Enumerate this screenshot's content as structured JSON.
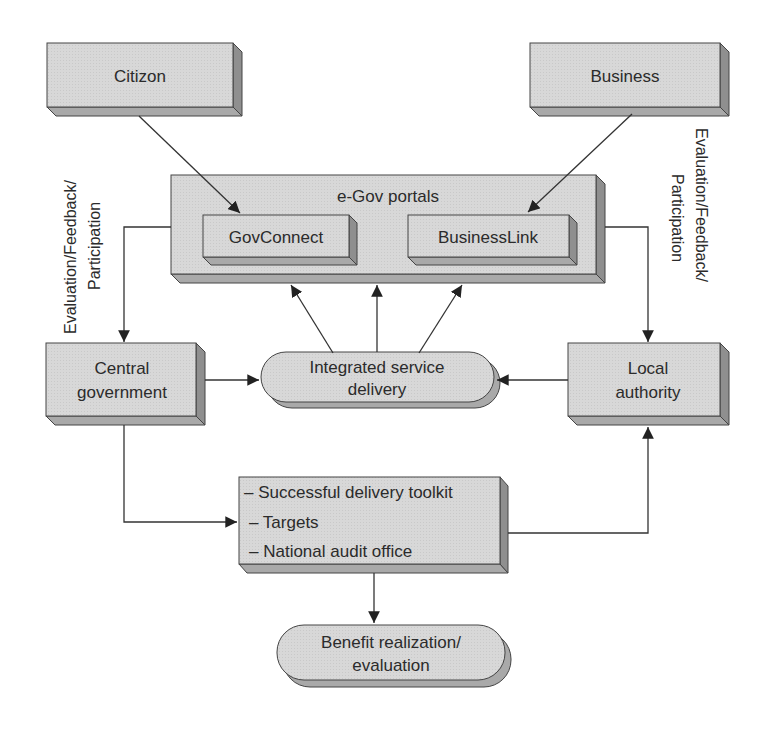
{
  "diagram": {
    "nodes": {
      "citizen": {
        "label": "Citizon"
      },
      "business": {
        "label": "Business"
      },
      "egov_portals": {
        "label": "e-Gov portals"
      },
      "govconnect": {
        "label": "GovConnect"
      },
      "businesslink": {
        "label": "BusinessLink"
      },
      "central_government": {
        "line1": "Central",
        "line2": "government"
      },
      "local_authority": {
        "line1": "Local",
        "line2": "authority"
      },
      "integrated_service": {
        "line1": "Integrated service",
        "line2": "delivery"
      },
      "toolkit": {
        "items": [
          "– Successful delivery toolkit",
          "– Targets",
          "– National audit office"
        ]
      },
      "benefit": {
        "line1": "Benefit realization/",
        "line2": "evaluation"
      }
    },
    "side_labels": {
      "left": {
        "line1": "Evaluation/Feedback/",
        "line2": "Participation"
      },
      "right": {
        "line1": "Evaluation/Feedback/",
        "line2": "Participation"
      }
    },
    "edges": [
      {
        "from": "citizen",
        "to": "govconnect"
      },
      {
        "from": "business",
        "to": "businesslink"
      },
      {
        "from": "egov_portals",
        "to": "central_government"
      },
      {
        "from": "egov_portals",
        "to": "local_authority"
      },
      {
        "from": "integrated_service",
        "to": "egov_portals",
        "count": 3
      },
      {
        "from": "central_government",
        "to": "integrated_service"
      },
      {
        "from": "local_authority",
        "to": "integrated_service"
      },
      {
        "from": "central_government",
        "to": "toolkit"
      },
      {
        "from": "toolkit",
        "to": "local_authority"
      },
      {
        "from": "toolkit",
        "to": "benefit"
      }
    ],
    "colors": {
      "box_face": "#d6d6d6",
      "box_side": "#9a9a9a",
      "box_bottom": "#a8a8a8",
      "line": "#333333"
    }
  }
}
